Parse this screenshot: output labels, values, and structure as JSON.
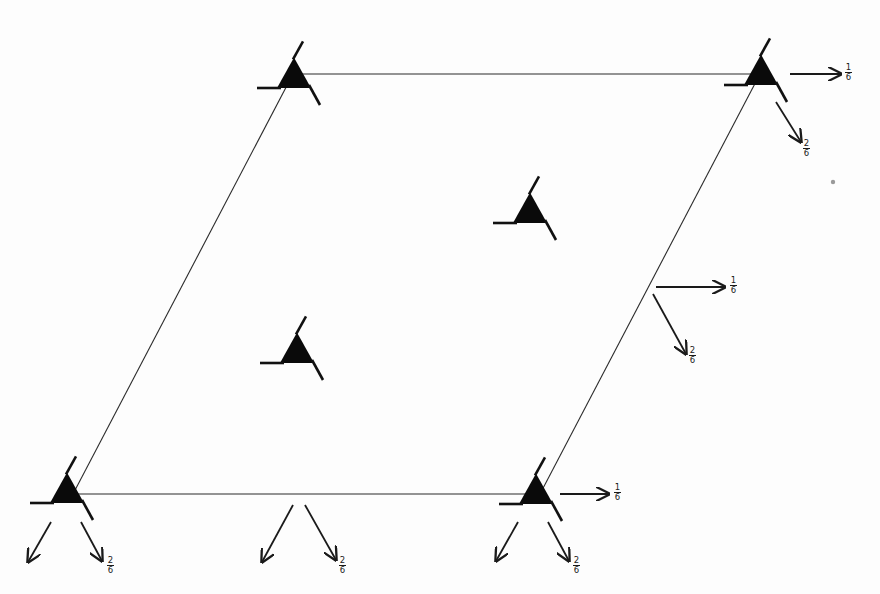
{
  "diagram": {
    "type": "space-group symmetry element diagram (hexagonal/trigonal cell)",
    "background": "#fdfdfd",
    "cell": {
      "corners": {
        "bottom_left": [
          73,
          494
        ],
        "top_left": [
          293,
          74
        ],
        "top_right": [
          760,
          74
        ],
        "bottom_right": [
          540,
          494
        ]
      },
      "edge_color": "#2a2a2a"
    },
    "symbols": [
      {
        "id": "corner-bottom-left",
        "label": "screw-axis-triangle",
        "base": [
          50,
          503
        ],
        "size": 34
      },
      {
        "id": "corner-top-left",
        "label": "screw-axis-triangle",
        "base": [
          277,
          88
        ],
        "size": 34
      },
      {
        "id": "corner-top-right",
        "label": "screw-axis-triangle",
        "base": [
          744,
          85
        ],
        "size": 34
      },
      {
        "id": "corner-bottom-right",
        "label": "screw-axis-triangle",
        "base": [
          519,
          504
        ],
        "size": 34
      },
      {
        "id": "interior-upper",
        "label": "screw-axis-triangle",
        "base": [
          513,
          223
        ],
        "size": 34
      },
      {
        "id": "interior-lower",
        "label": "screw-axis-triangle",
        "base": [
          280,
          363
        ],
        "size": 34
      }
    ],
    "arrows": [
      {
        "id": "tr-horizontal",
        "from": [
          790,
          74
        ],
        "to": [
          841,
          74
        ],
        "label": {
          "num": "1",
          "den": "6",
          "pos": [
            849,
            66
          ]
        }
      },
      {
        "id": "tr-diagonal",
        "from": [
          776,
          102
        ],
        "to": [
          801,
          142
        ],
        "label": {
          "num": "2",
          "den": "6",
          "pos": [
            807,
            142
          ]
        }
      },
      {
        "id": "mid-horizontal",
        "from": [
          656,
          287
        ],
        "to": [
          725,
          287
        ],
        "label": {
          "num": "1",
          "den": "6",
          "pos": [
            734,
            279
          ]
        }
      },
      {
        "id": "mid-diagonal",
        "from": [
          653,
          294
        ],
        "to": [
          686,
          354
        ],
        "label": {
          "num": "2",
          "den": "6",
          "pos": [
            693,
            349
          ]
        }
      },
      {
        "id": "br-horizontal",
        "from": [
          560,
          494
        ],
        "to": [
          609,
          494
        ],
        "label": {
          "num": "1",
          "den": "6",
          "pos": [
            618,
            486
          ]
        }
      },
      {
        "id": "br-down-left",
        "from": [
          518,
          522
        ],
        "to": [
          496,
          561
        ],
        "label": null
      },
      {
        "id": "br-diagonal",
        "from": [
          548,
          522
        ],
        "to": [
          569,
          561
        ],
        "label": {
          "num": "2",
          "den": "6",
          "pos": [
            577,
            559
          ]
        }
      },
      {
        "id": "bl-down-left",
        "from": [
          51,
          522
        ],
        "to": [
          28,
          562
        ],
        "label": null
      },
      {
        "id": "bl-diagonal",
        "from": [
          81,
          522
        ],
        "to": [
          102,
          561
        ],
        "label": {
          "num": "2",
          "den": "6",
          "pos": [
            111,
            559
          ]
        }
      },
      {
        "id": "bm-down-left",
        "from": [
          293,
          505
        ],
        "to": [
          262,
          562
        ],
        "label": null
      },
      {
        "id": "bm-diagonal",
        "from": [
          305,
          505
        ],
        "to": [
          336,
          560
        ],
        "label": {
          "num": "2",
          "den": "6",
          "pos": [
            343,
            559
          ]
        }
      }
    ],
    "stray_marks": [
      {
        "id": "dot",
        "pos": [
          833,
          182
        ],
        "r": 2.2,
        "color": "#9a9a9a"
      }
    ]
  }
}
